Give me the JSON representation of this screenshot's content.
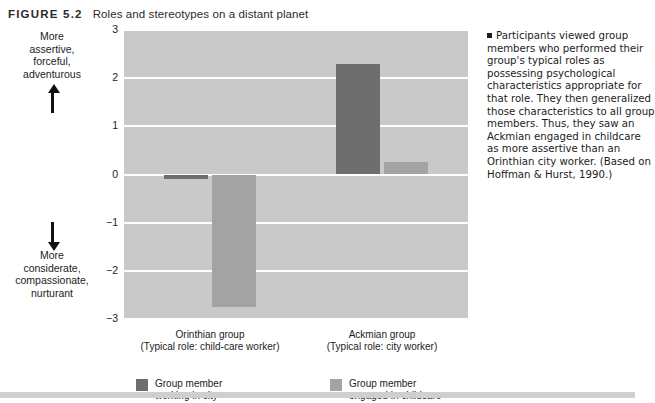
{
  "figure": {
    "number": "FIGURE 5.2",
    "title": "Roles and stereotypes on a distant planet"
  },
  "caption": {
    "text": "Participants viewed group members who performed their group's typical roles as possessing psychological characteristics appropriate for that role. They then generalized those characteristics to all group members. Thus, they saw an Ackmian engaged in childcare as more assertive than an Orinthian city worker. (Based on Hoffman & Hurst, 1990.)"
  },
  "axis_annotations": {
    "top": "More\nassertive,\nforceful,\nadventurous",
    "top_lines": [
      "More",
      "assertive,",
      "forceful,",
      "adventurous"
    ],
    "bottom_lines": [
      "More",
      "considerate,",
      "compassionate,",
      "nurturant"
    ],
    "up_arrow_icon": "arrow-up-icon",
    "down_arrow_icon": "arrow-down-icon"
  },
  "chart_data": {
    "type": "bar",
    "title": "Roles and stereotypes on a distant planet",
    "xlabel": "",
    "ylabel": "",
    "ylim": [
      -3,
      3
    ],
    "yticks": [
      3,
      2,
      1,
      0,
      -1,
      -2,
      -3
    ],
    "ytick_labels": [
      "3",
      "2",
      "1",
      "0",
      "−1",
      "−2",
      "−3"
    ],
    "grid": true,
    "legend_position": "bottom",
    "categories": [
      "Orinthian group",
      "Ackmian group"
    ],
    "category_sublabels": [
      "(Typical role: child-care worker)",
      "(Typical role: city worker)"
    ],
    "series": [
      {
        "name": "Group member working in city",
        "name_lines": [
          "Group member",
          "working in city"
        ],
        "color": "#6e6e6e",
        "values": [
          -0.1,
          2.3
        ]
      },
      {
        "name": "Group member engaged in childcare",
        "name_lines": [
          "Group member",
          "engaged in childcare"
        ],
        "color": "#a3a3a3",
        "values": [
          -2.75,
          0.25
        ]
      }
    ]
  },
  "colors": {
    "plot_background": "#c9c9c9",
    "gridline": "#ffffff",
    "series_dark": "#6e6e6e",
    "series_light": "#a3a3a3",
    "page_background": "#ffffff",
    "text": "#1c1c1c"
  }
}
